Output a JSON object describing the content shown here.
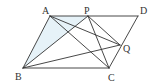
{
  "diagram": {
    "type": "geometry",
    "colors": {
      "stroke": "#333333",
      "shade": "#e6f2f8",
      "background": "#ffffff"
    },
    "points": {
      "A": {
        "label": "A",
        "x": 50,
        "y": 16
      },
      "P": {
        "label": "P",
        "x": 88,
        "y": 16
      },
      "D": {
        "label": "D",
        "x": 138,
        "y": 16
      },
      "B": {
        "label": "B",
        "x": 23,
        "y": 68
      },
      "C": {
        "label": "C",
        "x": 109,
        "y": 68
      },
      "Q": {
        "label": "Q",
        "x": 120,
        "y": 45
      }
    },
    "segments": [
      "AD",
      "BC",
      "AB",
      "CD",
      "AC",
      "AQ",
      "BP",
      "BQ",
      "PC",
      "PQ"
    ],
    "shaded_region": [
      "A",
      "B",
      "P"
    ]
  }
}
